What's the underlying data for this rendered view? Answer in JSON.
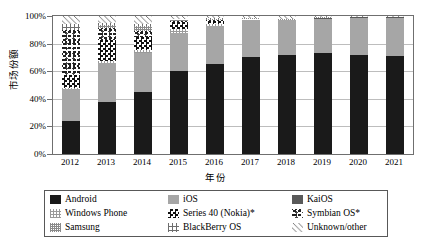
{
  "chart_data": {
    "type": "bar",
    "subtype": "stacked-100-percent",
    "title": "",
    "xlabel": "年份",
    "ylabel": "市场份额",
    "ylim": [
      0,
      100
    ],
    "ytick_labels": [
      "0%",
      "20%",
      "40%",
      "60%",
      "80%",
      "100%"
    ],
    "ytick_values": [
      0,
      20,
      40,
      60,
      80,
      100
    ],
    "grid": true,
    "legend_position": "bottom",
    "categories": [
      "2012",
      "2013",
      "2014",
      "2015",
      "2016",
      "2017",
      "2018",
      "2019",
      "2020",
      "2021"
    ],
    "series": [
      {
        "name": "Android",
        "pattern": "solid-black",
        "color": "#1a1a1a",
        "values": [
          24,
          38,
          45,
          60,
          65,
          70,
          72,
          73,
          72,
          71
        ]
      },
      {
        "name": "iOS",
        "pattern": "solid-gray",
        "color": "#a6a6a6",
        "values": [
          23,
          28,
          28,
          28,
          28,
          27,
          25,
          25,
          27,
          28
        ]
      },
      {
        "name": "KaiOS",
        "pattern": "solid-dark-gray",
        "color": "#595959",
        "values": [
          0,
          0,
          0,
          0,
          0,
          0,
          0,
          0.5,
          0.5,
          0.4
        ]
      },
      {
        "name": "Windows Phone",
        "pattern": "fine-grid",
        "color": "#9a9a9a",
        "values": [
          1,
          1.5,
          2.5,
          2.5,
          1.5,
          0.5,
          0,
          0,
          0,
          0
        ]
      },
      {
        "name": "Series 40 (Nokia)*",
        "pattern": "checkerboard",
        "color": "#111111",
        "values": [
          9,
          15,
          9,
          5,
          2,
          0.5,
          0,
          0,
          0,
          0
        ]
      },
      {
        "name": "Symbian OS*",
        "pattern": "speckle",
        "color": "#222222",
        "values": [
          33,
          9,
          5,
          1,
          0.5,
          0,
          0,
          0,
          0,
          0
        ]
      },
      {
        "name": "Samsung",
        "pattern": "dense-grid",
        "color": "#8a8a8a",
        "values": [
          0,
          2,
          3.5,
          1,
          1,
          0.5,
          0.5,
          0.5,
          0,
          0
        ]
      },
      {
        "name": "BlackBerry OS",
        "pattern": "coarse-grid",
        "color": "#6e6e6e",
        "values": [
          4,
          1.5,
          1,
          0.5,
          0.5,
          0,
          0,
          0,
          0,
          0
        ]
      },
      {
        "name": "Unknown/other",
        "pattern": "diagonal-hatch",
        "color": "#6e6e6e",
        "values": [
          6,
          5,
          6,
          2,
          1.5,
          1.5,
          2.5,
          1,
          0.5,
          0.6
        ]
      }
    ]
  },
  "legend": {
    "items": [
      {
        "label": "Android",
        "swatch": "android-swatch"
      },
      {
        "label": "iOS",
        "swatch": "ios-swatch"
      },
      {
        "label": "KaiOS",
        "swatch": "kaios-swatch"
      },
      {
        "label": "Windows Phone",
        "swatch": "windows-phone-swatch"
      },
      {
        "label": "Series 40 (Nokia)*",
        "swatch": "series40-swatch"
      },
      {
        "label": "Symbian OS*",
        "swatch": "symbian-swatch"
      },
      {
        "label": "Samsung",
        "swatch": "samsung-swatch"
      },
      {
        "label": "BlackBerry OS",
        "swatch": "blackberry-swatch"
      },
      {
        "label": "Unknown/other",
        "swatch": "unknown-other-swatch"
      }
    ]
  }
}
